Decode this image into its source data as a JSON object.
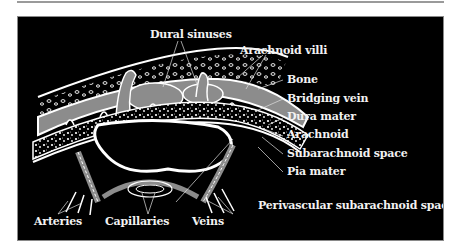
{
  "diagram": {
    "colors": {
      "background": "#000000",
      "fluid_space": "#8c8c8c",
      "membrane": "#ffffff",
      "label_text": "#f2f2f2"
    },
    "labels": {
      "dural_sinuses": "Dural sinuses",
      "arachnoid_villi": "Arachnoid villi",
      "bone": "Bone",
      "bridging_vein": "Bridging vein",
      "dura_mater": "Dura mater",
      "arachnoid": "Arachnoid",
      "subarachnoid_space": "Subarachnoid space",
      "pia_mater": "Pia mater",
      "perivascular_space": "Perivascular subarachnoid space",
      "arteries": "Arteries",
      "capillaries": "Capillaries",
      "veins": "Veins"
    }
  }
}
